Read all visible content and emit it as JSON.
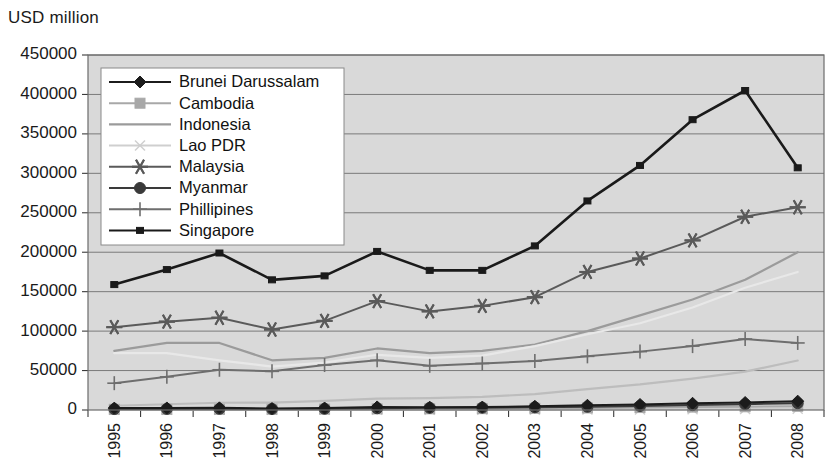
{
  "chart_data": {
    "type": "line",
    "title": "USD million",
    "ylabel": "USD million",
    "xlabel": "",
    "grid": true,
    "legend_position": "upper-left-inside",
    "ylim": [
      0,
      450000
    ],
    "ytick_step": 50000,
    "ytick_labels": [
      "0",
      "50000",
      "100000",
      "150000",
      "200000",
      "250000",
      "300000",
      "350000",
      "400000",
      "450000"
    ],
    "categories": [
      "1995",
      "1996",
      "1997",
      "1998",
      "1999",
      "2000",
      "2001",
      "2002",
      "2003",
      "2004",
      "2005",
      "2006",
      "2007",
      "2008"
    ],
    "series": [
      {
        "name": "Brunei Darussalam",
        "marker": "diamond",
        "color": "#1c1c1c",
        "values": [
          2400,
          2600,
          2700,
          1900,
          2500,
          3900,
          3600,
          3700,
          4700,
          6000,
          7000,
          8500,
          9500,
          11200
        ]
      },
      {
        "name": "Cambodia",
        "marker": "square",
        "color": "#a8a8a8",
        "values": [
          860,
          840,
          900,
          1000,
          1100,
          1400,
          1500,
          1700,
          2100,
          2600,
          3100,
          3700,
          4100,
          4700
        ]
      },
      {
        "name": "Indonesia",
        "marker": "none",
        "color": "#9b9b9b",
        "values": [
          75000,
          85000,
          85000,
          63000,
          66000,
          78000,
          72000,
          75000,
          83000,
          100000,
          120000,
          140000,
          165000,
          200000
        ]
      },
      {
        "name": "Lao PDR",
        "marker": "x",
        "color": "#cfcfcf",
        "values": [
          370,
          330,
          360,
          340,
          340,
          340,
          340,
          340,
          440,
          540,
          660,
          1030,
          1320,
          1600
        ]
      },
      {
        "name": "Malaysia",
        "marker": "asterisk",
        "color": "#5a5a5a",
        "values": [
          105000,
          112000,
          117000,
          102000,
          113000,
          138000,
          125000,
          132000,
          143000,
          175000,
          192000,
          215000,
          245000,
          257000
        ]
      },
      {
        "name": "Myanmar",
        "marker": "circle",
        "color": "#3a3a3a",
        "values": [
          1200,
          1400,
          1500,
          1300,
          1600,
          2200,
          2800,
          3000,
          3500,
          4100,
          5100,
          6200,
          7400,
          8600
        ]
      },
      {
        "name": "Phillipines",
        "marker": "plus",
        "color": "#6e6e6e",
        "values": [
          34000,
          42000,
          51000,
          49000,
          57000,
          63000,
          56000,
          59000,
          62000,
          68000,
          74000,
          81000,
          90000,
          85000
        ]
      },
      {
        "name": "Singapore",
        "marker": "small-square",
        "color": "#1a1a1a",
        "values": [
          159000,
          178000,
          199000,
          165000,
          170000,
          201000,
          177000,
          177000,
          208000,
          265000,
          310000,
          368000,
          405000,
          307000
        ]
      },
      {
        "name": "Thailand",
        "marker": "none",
        "color": "#e8e8e8",
        "values": [
          72000,
          72000,
          63000,
          55000,
          60000,
          70000,
          66000,
          69000,
          81000,
          96000,
          110000,
          130000,
          155000,
          175000
        ]
      },
      {
        "name": "Vietnam",
        "marker": "none",
        "color": "#bdbdbd",
        "values": [
          5400,
          7300,
          9200,
          9400,
          11500,
          14400,
          15000,
          16700,
          20100,
          26500,
          32400,
          39800,
          48600,
          62700
        ]
      }
    ]
  },
  "legend": {
    "items": [
      {
        "label": "Brunei Darussalam"
      },
      {
        "label": "Cambodia"
      },
      {
        "label": "Indonesia"
      },
      {
        "label": "Lao PDR"
      },
      {
        "label": "Malaysia"
      },
      {
        "label": "Myanmar"
      },
      {
        "label": "Phillipines"
      },
      {
        "label": "Singapore"
      },
      {
        "label": "Thailand"
      },
      {
        "label": "Vietnam"
      }
    ]
  }
}
